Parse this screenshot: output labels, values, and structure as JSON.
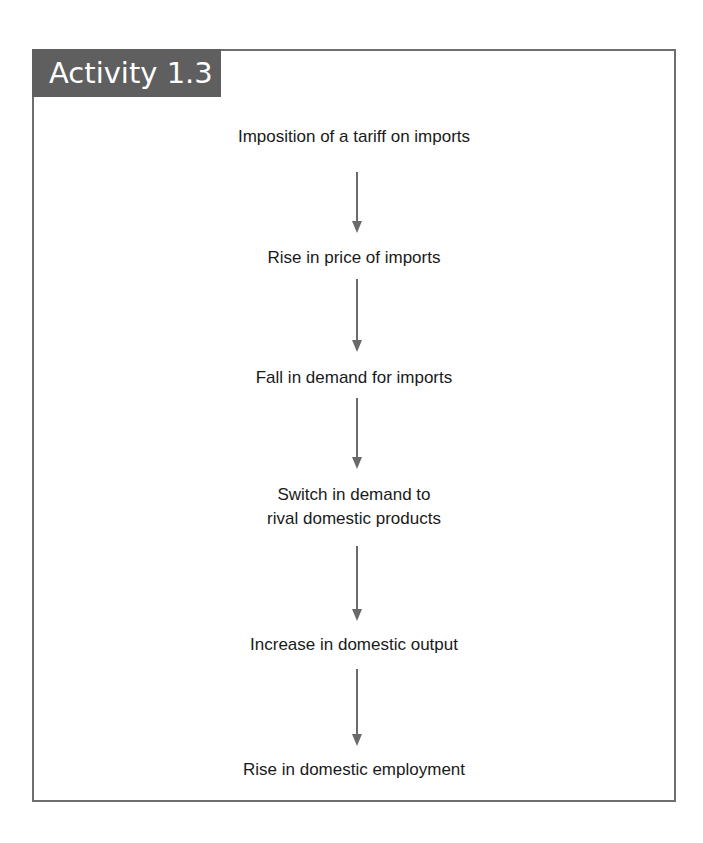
{
  "header": {
    "title": "Activity 1.3"
  },
  "flow": {
    "steps": [
      {
        "label": "Imposition of a tariff on imports"
      },
      {
        "label": "Rise in price of imports"
      },
      {
        "label": "Fall in demand for imports"
      },
      {
        "label": "Switch in demand to",
        "label2": "rival domestic products"
      },
      {
        "label": "Increase in domestic output"
      },
      {
        "label": "Rise in domestic employment"
      }
    ],
    "arrow_color": "#6a6a6a",
    "header_bg": "#5f5f5f"
  }
}
